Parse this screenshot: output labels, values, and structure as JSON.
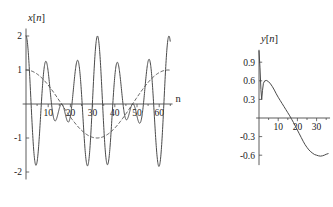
{
  "figure": {
    "name": "two-signal-plots",
    "background_color": "#ffffff",
    "ink_color": "#4a4a4a",
    "text_color": "#1a1a1a"
  },
  "chart_data": [
    {
      "id": "left",
      "type": "line",
      "title": "",
      "ylabel": "x[n]",
      "ylabel_italic_parts": [
        "x",
        "n"
      ],
      "xlabel": "n",
      "xlim": [
        -2,
        67
      ],
      "ylim": [
        -2.25,
        2.25
      ],
      "grid": false,
      "legend": "none",
      "xticks": [
        10,
        20,
        30,
        40,
        50,
        60
      ],
      "xtick_labels": [
        "10",
        "20",
        "30",
        "40",
        "50",
        "60"
      ],
      "xminor_ticks": [
        5,
        15,
        25,
        35,
        45,
        55,
        65
      ],
      "yticks": [
        2,
        1,
        -1,
        -2
      ],
      "ytick_labels": [
        "2",
        "1",
        "-1",
        "-2"
      ],
      "series": [
        {
          "name": "modulated-signal",
          "style": "solid",
          "formula": "cos(2*pi*n/9.2) * cos(2*pi*n/64)",
          "x_start": 0,
          "x_end": 65,
          "x_step": 0.08,
          "carrier_period": 9.2,
          "envelope_period": 64,
          "amplitude": 2.0
        },
        {
          "name": "envelope",
          "style": "dashed",
          "formula": "cos(2*pi*n/64)",
          "x_start": 0,
          "x_end": 65,
          "x_step": 0.4,
          "envelope_period": 64,
          "amplitude": 1.0
        }
      ]
    },
    {
      "id": "right",
      "type": "line",
      "title": "",
      "ylabel": "y[n]",
      "ylabel_italic_parts": [
        "y",
        "n"
      ],
      "xlabel": "",
      "xlim": [
        -2,
        37
      ],
      "ylim": [
        -0.78,
        1.12
      ],
      "grid": false,
      "legend": "none",
      "xticks": [
        10,
        20,
        30
      ],
      "xtick_labels": [
        "10",
        "20",
        "30"
      ],
      "xminor_ticks": [
        5,
        15,
        25,
        35
      ],
      "yticks": [
        0.9,
        0.6,
        0.3,
        -0.3,
        -0.6
      ],
      "ytick_labels": [
        "0.9",
        "0.6",
        "0.3",
        "-0.3",
        "-0.6"
      ],
      "series": [
        {
          "name": "filtered-output",
          "style": "solid",
          "points": [
            [
              0.0,
              1.08
            ],
            [
              0.5,
              0.82
            ],
            [
              1.0,
              0.46
            ],
            [
              1.4,
              0.3
            ],
            [
              1.8,
              0.44
            ],
            [
              2.3,
              0.56
            ],
            [
              3.0,
              0.6
            ],
            [
              4.0,
              0.605
            ],
            [
              5.0,
              0.585
            ],
            [
              6.0,
              0.55
            ],
            [
              7.0,
              0.505
            ],
            [
              8.0,
              0.45
            ],
            [
              9.0,
              0.39
            ],
            [
              10.0,
              0.335
            ],
            [
              11.0,
              0.285
            ],
            [
              12.0,
              0.235
            ],
            [
              13.0,
              0.185
            ],
            [
              14.0,
              0.135
            ],
            [
              15.0,
              0.085
            ],
            [
              16.0,
              0.035
            ],
            [
              17.0,
              -0.02
            ],
            [
              18.0,
              -0.075
            ],
            [
              19.0,
              -0.135
            ],
            [
              20.0,
              -0.195
            ],
            [
              21.0,
              -0.255
            ],
            [
              22.0,
              -0.315
            ],
            [
              23.0,
              -0.375
            ],
            [
              24.0,
              -0.43
            ],
            [
              25.0,
              -0.475
            ],
            [
              26.0,
              -0.515
            ],
            [
              27.0,
              -0.545
            ],
            [
              28.0,
              -0.57
            ],
            [
              29.0,
              -0.59
            ],
            [
              30.0,
              -0.6
            ],
            [
              31.0,
              -0.61
            ],
            [
              32.0,
              -0.615
            ],
            [
              33.0,
              -0.61
            ],
            [
              34.0,
              -0.6
            ],
            [
              35.0,
              -0.585
            ],
            [
              36.0,
              -0.575
            ]
          ]
        }
      ]
    }
  ]
}
